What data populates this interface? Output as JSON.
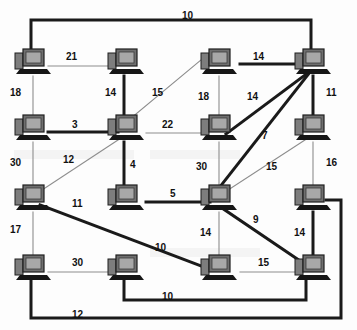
{
  "diagram": {
    "node_icon": "desktop-computer-icon",
    "colors": {
      "background": "#fdfdfd",
      "thick_edge": "#1a1a1a",
      "thin_edge": "#8d8d8d",
      "label_text": "#111111",
      "monitor_screen": "#9a9a9a",
      "monitor_body": "#6f6f6f",
      "base": "#161616"
    },
    "grid": {
      "columns_x": [
        32,
        125,
        218,
        312
      ],
      "rows_y": [
        62,
        128,
        198,
        268
      ]
    },
    "nodes": [
      {
        "id": "n11",
        "row": 1,
        "col": 1,
        "x": 32,
        "y": 62
      },
      {
        "id": "n12",
        "row": 1,
        "col": 2,
        "x": 125,
        "y": 62
      },
      {
        "id": "n13",
        "row": 1,
        "col": 3,
        "x": 218,
        "y": 62
      },
      {
        "id": "n14",
        "row": 1,
        "col": 4,
        "x": 312,
        "y": 62
      },
      {
        "id": "n21",
        "row": 2,
        "col": 1,
        "x": 32,
        "y": 128
      },
      {
        "id": "n22",
        "row": 2,
        "col": 2,
        "x": 125,
        "y": 128
      },
      {
        "id": "n23",
        "row": 2,
        "col": 3,
        "x": 218,
        "y": 128
      },
      {
        "id": "n24",
        "row": 2,
        "col": 4,
        "x": 312,
        "y": 128
      },
      {
        "id": "n31",
        "row": 3,
        "col": 1,
        "x": 32,
        "y": 198
      },
      {
        "id": "n32",
        "row": 3,
        "col": 2,
        "x": 125,
        "y": 198
      },
      {
        "id": "n33",
        "row": 3,
        "col": 3,
        "x": 218,
        "y": 198
      },
      {
        "id": "n34",
        "row": 3,
        "col": 4,
        "x": 312,
        "y": 198
      },
      {
        "id": "n41",
        "row": 4,
        "col": 1,
        "x": 32,
        "y": 268
      },
      {
        "id": "n42",
        "row": 4,
        "col": 2,
        "x": 125,
        "y": 268
      },
      {
        "id": "n43",
        "row": 4,
        "col": 3,
        "x": 218,
        "y": 268
      },
      {
        "id": "n44",
        "row": 4,
        "col": 4,
        "x": 312,
        "y": 268
      }
    ],
    "edges": [
      {
        "from": "n11",
        "to": "n14",
        "weight": "10",
        "style": "thick",
        "route": "top-bus",
        "label_x": 182,
        "label_y": 11
      },
      {
        "from": "n11",
        "to": "n12",
        "weight": "21",
        "style": "thin",
        "label_x": 66,
        "label_y": 52
      },
      {
        "from": "n13",
        "to": "n14",
        "weight": "14",
        "style": "thick",
        "label_x": 253,
        "label_y": 52
      },
      {
        "from": "n11",
        "to": "n21",
        "weight": "18",
        "style": "thin",
        "label_x": 10,
        "label_y": 88
      },
      {
        "from": "n12",
        "to": "n22",
        "weight": "14",
        "style": "thick",
        "label_x": 105,
        "label_y": 88
      },
      {
        "from": "n22",
        "to": "n13",
        "weight": "15",
        "style": "thin",
        "label_x": 152,
        "label_y": 88
      },
      {
        "from": "n13",
        "to": "n23",
        "weight": "18",
        "style": "thin",
        "label_x": 198,
        "label_y": 92
      },
      {
        "from": "n14",
        "to": "n23",
        "weight": "14",
        "style": "thick",
        "label_x": 247,
        "label_y": 92
      },
      {
        "from": "n14",
        "to": "n24",
        "weight": "11",
        "style": "thick",
        "label_x": 326,
        "label_y": 88
      },
      {
        "from": "n21",
        "to": "n22",
        "weight": "3",
        "style": "thick",
        "label_x": 72,
        "label_y": 120
      },
      {
        "from": "n22",
        "to": "n23",
        "weight": "22",
        "style": "thin",
        "label_x": 162,
        "label_y": 120
      },
      {
        "from": "n14",
        "to": "n33",
        "weight": "7",
        "style": "thick",
        "label_x": 262,
        "label_y": 131
      },
      {
        "from": "n21",
        "to": "n31",
        "weight": "30",
        "style": "thin",
        "label_x": 10,
        "label_y": 158
      },
      {
        "from": "n31",
        "to": "n22",
        "weight": "12",
        "style": "thin",
        "label_x": 63,
        "label_y": 155
      },
      {
        "from": "n22",
        "to": "n32",
        "weight": "4",
        "style": "thick",
        "label_x": 130,
        "label_y": 160
      },
      {
        "from": "n23",
        "to": "n33",
        "weight": "30",
        "style": "thin",
        "label_x": 196,
        "label_y": 162
      },
      {
        "from": "n33",
        "to": "n24",
        "weight": "15",
        "style": "thin",
        "label_x": 266,
        "label_y": 162
      },
      {
        "from": "n24",
        "to": "n34",
        "weight": "16",
        "style": "thin",
        "label_x": 326,
        "label_y": 158
      },
      {
        "from": "n32",
        "to": "n33",
        "weight": "5",
        "style": "thick",
        "label_x": 170,
        "label_y": 189
      },
      {
        "from": "n31",
        "to": "n43",
        "weight": "11",
        "style": "thick",
        "label_x": 72,
        "label_y": 199
      },
      {
        "from": "n33",
        "to": "n44",
        "weight": "9",
        "style": "thick",
        "label_x": 253,
        "label_y": 215
      },
      {
        "from": "n31",
        "to": "n41",
        "weight": "17",
        "style": "thin",
        "label_x": 10,
        "label_y": 225
      },
      {
        "from": "n33",
        "to": "n43",
        "weight": "14",
        "style": "thin",
        "label_x": 200,
        "label_y": 228
      },
      {
        "from": "n34",
        "to": "n44",
        "weight": "14",
        "style": "thick",
        "label_x": 294,
        "label_y": 228
      },
      {
        "from": "n31",
        "to": "n43",
        "weight": "10",
        "style": "thick",
        "route": "diagonal-end",
        "label_x": 155,
        "label_y": 243
      },
      {
        "from": "n41",
        "to": "n42",
        "weight": "30",
        "style": "thin",
        "label_x": 72,
        "label_y": 258
      },
      {
        "from": "n43",
        "to": "n44",
        "weight": "15",
        "style": "thin",
        "label_x": 258,
        "label_y": 258
      },
      {
        "from": "n42",
        "to": "n44",
        "weight": "10",
        "style": "thick",
        "route": "bottom-bus-inner",
        "label_x": 162,
        "label_y": 292
      },
      {
        "from": "n41",
        "to": "n34",
        "weight": "12",
        "style": "thick",
        "route": "bottom-bus-outer",
        "label_x": 72,
        "label_y": 310
      }
    ]
  }
}
